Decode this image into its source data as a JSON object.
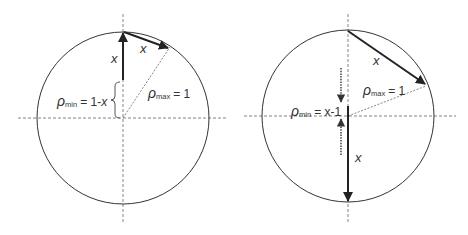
{
  "figure": {
    "left_panel": {
      "chord_label": "x",
      "radius_label_var": "x",
      "rho_min": {
        "symbol": "ρ",
        "subscript": "min",
        "rhs": "= 1-",
        "rhs_var": "x"
      },
      "rho_max": {
        "symbol": "ρ",
        "subscript": "max",
        "rhs": "= 1"
      }
    },
    "right_panel": {
      "chord_label": "x",
      "radius_label_var": "x",
      "rho_min": {
        "symbol": "ρ",
        "subscript": "min",
        "rhs": "= x-1"
      },
      "rho_max": {
        "symbol": "ρ",
        "subscript": "max",
        "rhs": "= 1"
      }
    },
    "colors": {
      "line": "#333333",
      "dashed": "#666666",
      "arrow": "#222222"
    }
  }
}
